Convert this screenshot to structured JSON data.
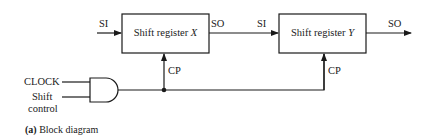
{
  "diagram": {
    "caption": {
      "tag": "(a)",
      "text": "Block diagram"
    },
    "blocks": [
      {
        "id": "X",
        "label": "Shift register",
        "var": "X"
      },
      {
        "id": "Y",
        "label": "Shift register",
        "var": "Y"
      }
    ],
    "signals": {
      "si_in": "SI",
      "so_x": "SO",
      "si_y": "SI",
      "so_out": "SO",
      "cp_x": "CP",
      "cp_y": "CP",
      "clock": "CLOCK",
      "shift_control_line1": "Shift",
      "shift_control_line2": "control"
    },
    "gate": {
      "type": "AND",
      "inputs": [
        "CLOCK",
        "Shift control"
      ]
    },
    "colors": {
      "line": "#1a1a1a",
      "background": "#ffffff"
    }
  }
}
